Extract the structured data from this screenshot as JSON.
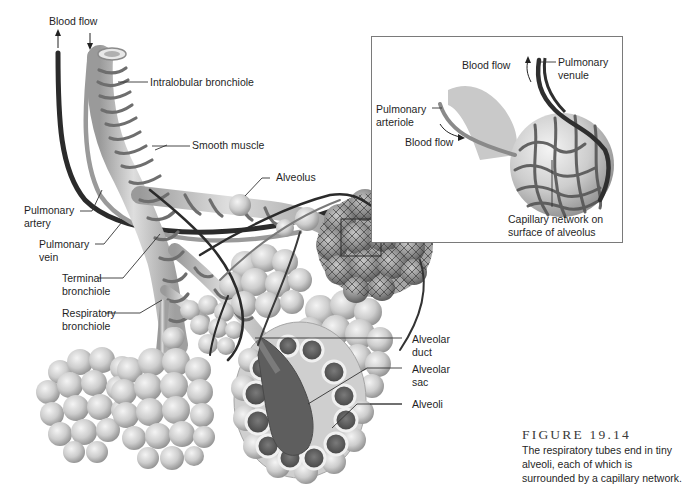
{
  "figure": {
    "number": "FIGURE 19.14",
    "caption": "The respiratory tubes end in tiny alveoli, each of which is surrounded by a capillary network."
  },
  "labels": {
    "blood_flow_top": "Blood flow",
    "intralobular_bronchiole": "Intralobular bronchiole",
    "smooth_muscle": "Smooth muscle",
    "alveolus": "Alveolus",
    "pulmonary_artery": [
      "Pulmonary",
      "artery"
    ],
    "pulmonary_vein": [
      "Pulmonary",
      "vein"
    ],
    "terminal_bronchiole": [
      "Terminal",
      "bronchiole"
    ],
    "respiratory_bronchiole": [
      "Respiratory",
      "bronchiole"
    ],
    "alveolar_duct": [
      "Alveolar",
      "duct"
    ],
    "alveolar_sac": [
      "Alveolar",
      "sac"
    ],
    "alveoli": "Alveoli"
  },
  "inset": {
    "blood_flow_out": "Blood flow",
    "pulmonary_venule": [
      "Pulmonary",
      "venule"
    ],
    "pulmonary_arteriole": [
      "Pulmonary",
      "arteriole"
    ],
    "blood_flow_in": "Blood flow",
    "capillary_network": [
      "Capillary network on",
      "surface of alveolus"
    ]
  },
  "colors": {
    "background": "#ffffff",
    "tube_light": "#cfcfcf",
    "tube_mid": "#a8a8a8",
    "muscle_band": "#6e6e6e",
    "artery": "#2b2b2b",
    "vein": "#9a9a9a",
    "alveolus_light": "#e2e2e2",
    "alveolus_shade": "#9c9c9c",
    "capillary": "#4a4a4a",
    "inset_border": "#7a7a7a"
  }
}
